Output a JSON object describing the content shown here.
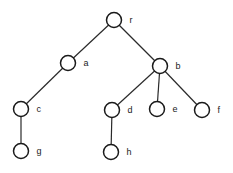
{
  "diagram": {
    "type": "tree",
    "node_radius": 7.5,
    "nodes": [
      {
        "id": "r",
        "label": "r",
        "x": 114,
        "y": 20
      },
      {
        "id": "a",
        "label": "a",
        "x": 68,
        "y": 63
      },
      {
        "id": "b",
        "label": "b",
        "x": 160,
        "y": 66
      },
      {
        "id": "c",
        "label": "c",
        "x": 21,
        "y": 109
      },
      {
        "id": "d",
        "label": "d",
        "x": 112,
        "y": 110
      },
      {
        "id": "e",
        "label": "e",
        "x": 157,
        "y": 109
      },
      {
        "id": "f",
        "label": "f",
        "x": 202,
        "y": 110
      },
      {
        "id": "g",
        "label": "g",
        "x": 21,
        "y": 151
      },
      {
        "id": "h",
        "label": "h",
        "x": 111,
        "y": 152
      }
    ],
    "edges": [
      {
        "from": "r",
        "to": "a"
      },
      {
        "from": "r",
        "to": "b"
      },
      {
        "from": "a",
        "to": "c"
      },
      {
        "from": "b",
        "to": "d"
      },
      {
        "from": "b",
        "to": "e"
      },
      {
        "from": "b",
        "to": "f"
      },
      {
        "from": "c",
        "to": "g"
      },
      {
        "from": "d",
        "to": "h"
      }
    ]
  }
}
